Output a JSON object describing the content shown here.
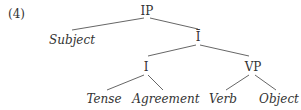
{
  "example_number": "(4)",
  "tree": {
    "nodes": {
      "ip": "IP",
      "subject": "Subject",
      "ibar": "Ī",
      "i": "I",
      "vp": "VP",
      "tense": "Tense",
      "agreement": "Agreement",
      "verb": "Verb",
      "object": "Object"
    },
    "edges": [
      [
        "IP",
        "Subject"
      ],
      [
        "IP",
        "Ī"
      ],
      [
        "Ī",
        "I"
      ],
      [
        "Ī",
        "VP"
      ],
      [
        "I",
        "Tense"
      ],
      [
        "I",
        "Agreement"
      ],
      [
        "VP",
        "Verb"
      ],
      [
        "VP",
        "Object"
      ]
    ]
  }
}
